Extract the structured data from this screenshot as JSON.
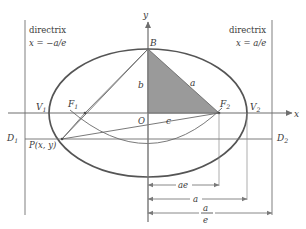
{
  "figure": {
    "colors": {
      "axis": "#6e6e6e",
      "ellipse": "#555555",
      "directrix": "#8a8a8a",
      "triangle_fill": "#9a9a9a",
      "triangle_stroke": "#6a6a6a",
      "text": "#3a3a3a",
      "dimension": "#7a7a7a",
      "background": "#ffffff"
    }
  },
  "axes": {
    "x_label": "x",
    "y_label": "y",
    "origin_label": "O"
  },
  "directrix": {
    "left": {
      "caption": "directrix",
      "equation": "x = −a/e",
      "endpoint_label": "D",
      "endpoint_sub": "1"
    },
    "right": {
      "caption": "directrix",
      "equation": "x = a/e",
      "endpoint_label": "D",
      "endpoint_sub": "2"
    }
  },
  "points": {
    "vertex_left": {
      "label": "V",
      "sub": "1"
    },
    "vertex_right": {
      "label": "V",
      "sub": "2"
    },
    "focus_left": {
      "label": "F",
      "sub": "1"
    },
    "focus_right": {
      "label": "F",
      "sub": "2"
    },
    "co_vertex_top": {
      "label": "B"
    },
    "point_on_ellipse": {
      "label": "P(x, y)"
    }
  },
  "triangle_labels": {
    "semi_minor": "b",
    "semi_major": "a",
    "focal_distance": "c"
  },
  "dimensions": [
    {
      "label": "ae",
      "from": "O",
      "to": "F2"
    },
    {
      "label": "a",
      "from": "O",
      "to": "V2"
    },
    {
      "numerator": "a",
      "denominator": "e",
      "from": "O",
      "to": "directrix-right"
    }
  ]
}
